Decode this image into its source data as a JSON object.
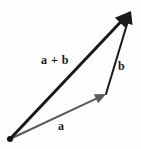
{
  "figure": {
    "background_color": "#fefefe",
    "width": 141,
    "height": 149
  },
  "labels": {
    "sum": "a + b",
    "b": "b",
    "a": "a"
  },
  "colors": {
    "vector_a": "#5a5a5a",
    "vector_b": "#1a1a1a",
    "vector_sum": "#1a1a1a",
    "origin_dot": "#111111",
    "label_text": "#1a1a1a"
  },
  "chart_data": {
    "type": "diagram",
    "subtype": "vector-diagram",
    "origin": {
      "x": 10,
      "y": 139
    },
    "vectors": [
      {
        "name": "a",
        "label": "a",
        "color": "#5a5a5a",
        "start": {
          "x": 10,
          "y": 139
        },
        "end": {
          "x": 106,
          "y": 94
        },
        "stroke_width": 2,
        "arrowhead": true,
        "label_position": {
          "x": 58,
          "y": 120
        }
      },
      {
        "name": "b",
        "label": "b",
        "color": "#1a1a1a",
        "start": {
          "x": 106,
          "y": 94
        },
        "end": {
          "x": 131,
          "y": 11
        },
        "stroke_width": 2,
        "arrowhead": true,
        "label_position": {
          "x": 118,
          "y": 60
        }
      },
      {
        "name": "a-plus-b",
        "label": "a + b",
        "color": "#1a1a1a",
        "start": {
          "x": 10,
          "y": 139
        },
        "end": {
          "x": 131,
          "y": 11
        },
        "stroke_width": 3,
        "arrowhead": true,
        "label_position": {
          "x": 41,
          "y": 54
        }
      }
    ]
  }
}
